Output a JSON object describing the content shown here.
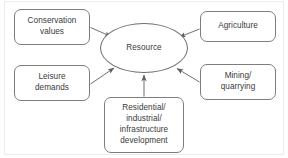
{
  "diagram": {
    "type": "concept-map",
    "center": {
      "id": "resource",
      "label": "Resource",
      "shape": "ellipse"
    },
    "nodes": [
      {
        "id": "conservation",
        "label": "Conservation\nvalues",
        "shape": "rounded-rect",
        "position": "top-left"
      },
      {
        "id": "agriculture",
        "label": "Agriculture",
        "shape": "rounded-rect",
        "position": "top-right"
      },
      {
        "id": "leisure",
        "label": "Leisure\ndemands",
        "shape": "rounded-rect",
        "position": "middle-left"
      },
      {
        "id": "mining",
        "label": "Mining/\nquarrying",
        "shape": "rounded-rect",
        "position": "middle-right"
      },
      {
        "id": "residential",
        "label": "Residential/\nindustrial/\ninfrastructure\ndevelopment",
        "shape": "rounded-rect",
        "position": "bottom-center"
      }
    ],
    "edges": [
      {
        "from": "conservation",
        "to": "resource",
        "arrow": "to"
      },
      {
        "from": "agriculture",
        "to": "resource",
        "arrow": "to"
      },
      {
        "from": "leisure",
        "to": "resource",
        "arrow": "to"
      },
      {
        "from": "mining",
        "to": "resource",
        "arrow": "to"
      },
      {
        "from": "residential",
        "to": "resource",
        "arrow": "to"
      }
    ],
    "colors": {
      "stroke": "#7d7d7d",
      "text": "#3a3a3a",
      "background": "#ffffff",
      "frame": "#ececec"
    }
  }
}
